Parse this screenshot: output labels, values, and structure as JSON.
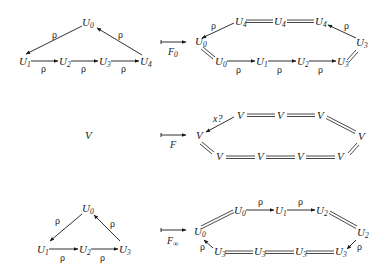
{
  "rows": [
    {
      "source": {
        "nodes": [
          {
            "id": "U0",
            "base": "U",
            "sub": "0"
          },
          {
            "id": "U1",
            "base": "U",
            "sub": "1"
          },
          {
            "id": "U2",
            "base": "U",
            "sub": "2"
          },
          {
            "id": "U3",
            "base": "U",
            "sub": "3"
          },
          {
            "id": "U4",
            "base": "U",
            "sub": "4"
          }
        ],
        "edge_label": "ρ"
      },
      "functor": {
        "base": "F",
        "sub": "0"
      },
      "target": {
        "top": [
          {
            "base": "U",
            "sub": "4"
          },
          {
            "base": "U",
            "sub": "4"
          },
          {
            "base": "U",
            "sub": "4"
          }
        ],
        "left": {
          "base": "U",
          "sub": "0"
        },
        "right": {
          "base": "U",
          "sub": "3"
        },
        "bottom": [
          {
            "base": "U",
            "sub": "0"
          },
          {
            "base": "U",
            "sub": "1"
          },
          {
            "base": "U",
            "sub": "2"
          },
          {
            "base": "U",
            "sub": "3"
          }
        ],
        "edge_label": "ρ"
      }
    },
    {
      "source": {
        "nodes": [
          {
            "id": "V",
            "base": "V",
            "sub": ""
          }
        ]
      },
      "functor": {
        "base": "F",
        "sub": ""
      },
      "target": {
        "top": [
          {
            "base": "V"
          },
          {
            "base": "V"
          },
          {
            "base": "V"
          }
        ],
        "left": {
          "base": "V"
        },
        "right": {
          "base": "V"
        },
        "bottom": [
          {
            "base": "V"
          },
          {
            "base": "V"
          },
          {
            "base": "V"
          },
          {
            "base": "V"
          }
        ],
        "edge_label": "x?"
      }
    },
    {
      "source": {
        "nodes": [
          {
            "id": "U0",
            "base": "U",
            "sub": "0"
          },
          {
            "id": "U1",
            "base": "U",
            "sub": "1"
          },
          {
            "id": "U2",
            "base": "U",
            "sub": "2"
          },
          {
            "id": "U3",
            "base": "U",
            "sub": "3"
          }
        ],
        "edge_label": "ρ"
      },
      "functor": {
        "base": "F",
        "sub": "∞"
      },
      "target": {
        "top": [
          {
            "base": "U",
            "sub": "0"
          },
          {
            "base": "U",
            "sub": "1"
          },
          {
            "base": "U",
            "sub": "2"
          }
        ],
        "left": {
          "base": "U",
          "sub": "0"
        },
        "right": {
          "base": "U",
          "sub": "2"
        },
        "bottom": [
          {
            "base": "U",
            "sub": "3"
          },
          {
            "base": "U",
            "sub": "3"
          },
          {
            "base": "U",
            "sub": "3"
          },
          {
            "base": "U",
            "sub": "3"
          }
        ],
        "edge_label": "ρ"
      }
    }
  ]
}
